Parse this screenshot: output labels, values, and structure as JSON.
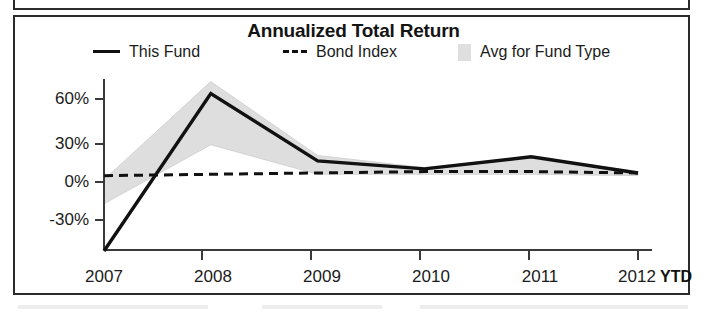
{
  "chart_panel": {
    "title": "Annualized Total Return"
  },
  "legend": {
    "entries": [
      {
        "label": "This Fund",
        "mark": "solid-line-swatch",
        "color": "#111111"
      },
      {
        "label": "Bond Index",
        "mark": "dashed-line-swatch",
        "color": "#111111"
      },
      {
        "label": "Avg for Fund Type",
        "mark": "shaded-area-swatch",
        "color": "#d8d8d8"
      }
    ]
  },
  "axes": {
    "y_ticks": [
      "60%",
      "30%",
      "0%",
      "-30%"
    ],
    "x_ticks": [
      "2007",
      "2008",
      "2009",
      "2010",
      "2011",
      "2012"
    ],
    "x_suffix_label": "YTD"
  },
  "chart_data": {
    "type": "line",
    "title": "Annualized Total Return",
    "xlabel": "",
    "ylabel": "",
    "x": [
      "2007",
      "2008",
      "2009",
      "2010",
      "2011",
      "2012"
    ],
    "x_tick_labels": [
      "2007",
      "2008",
      "2009",
      "2010",
      "2011",
      "2012"
    ],
    "x_axis_note": "YTD",
    "y_tick_labels": [
      "-30%",
      "0%",
      "30%",
      "60%"
    ],
    "y_ticks": [
      -30,
      0,
      30,
      60
    ],
    "ylim": [
      -55,
      75
    ],
    "grid": false,
    "legend_position": "top",
    "units": "percent",
    "series": [
      {
        "name": "This Fund",
        "style": "solid",
        "color": "#111111",
        "values": [
          -53,
          64,
          14,
          8,
          17,
          5
        ]
      },
      {
        "name": "Bond Index",
        "style": "dashed",
        "color": "#111111",
        "values": [
          3,
          4,
          5,
          6,
          6,
          5
        ]
      },
      {
        "name": "Avg for Fund Type",
        "style": "shaded-band",
        "color": "#d8d8d8",
        "band_upper": [
          0,
          73,
          18,
          9,
          17,
          6
        ],
        "band_lower": [
          -18,
          26,
          4,
          4,
          4,
          3
        ]
      }
    ]
  }
}
